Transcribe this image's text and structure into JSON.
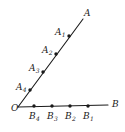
{
  "figure": {
    "kind": "geometry-angle-diagram",
    "width": 125,
    "height": 132,
    "background_color": "#ffffff",
    "stroke_color": "#1a1a1a",
    "dot_color": "#1a1a1a",
    "label_color": "#1a1a1a"
  },
  "vertex": {
    "name": "O",
    "label": "O",
    "x": 18,
    "y": 108
  },
  "rays": [
    {
      "name": "ray-OB",
      "from_x": 18,
      "from_y": 107,
      "to_x": 108,
      "to_y": 105,
      "endpoint_label": "B",
      "endpoint_label_x": 112,
      "endpoint_label_y": 100
    },
    {
      "name": "ray-OA",
      "from_x": 18,
      "from_y": 107,
      "to_x": 83,
      "to_y": 19,
      "endpoint_label": "A",
      "endpoint_label_x": 84,
      "endpoint_label_y": 9
    }
  ],
  "points_on_ray_OA": [
    {
      "label_main": "A",
      "label_sub": "4",
      "dot_x": 30,
      "dot_y": 90,
      "label_x": 16,
      "label_y": 83
    },
    {
      "label_main": "A",
      "label_sub": "3",
      "dot_x": 43,
      "dot_y": 72,
      "label_x": 29,
      "label_y": 64
    },
    {
      "label_main": "A",
      "label_sub": "2",
      "dot_x": 56,
      "dot_y": 54,
      "label_x": 42,
      "label_y": 46
    },
    {
      "label_main": "A",
      "label_sub": "1",
      "dot_x": 69,
      "dot_y": 36,
      "label_x": 55,
      "label_y": 28
    }
  ],
  "points_on_ray_OB": [
    {
      "label_main": "B",
      "label_sub": "4",
      "dot_x": 34,
      "dot_y": 106,
      "label_x": 29,
      "label_y": 112
    },
    {
      "label_main": "B",
      "label_sub": "3",
      "dot_x": 52,
      "dot_y": 106,
      "label_x": 47,
      "label_y": 112
    },
    {
      "label_main": "B",
      "label_sub": "2",
      "dot_x": 70,
      "dot_y": 106,
      "label_x": 65,
      "label_y": 112
    },
    {
      "label_main": "B",
      "label_sub": "1",
      "dot_x": 88,
      "dot_y": 106,
      "label_x": 83,
      "label_y": 112
    }
  ]
}
